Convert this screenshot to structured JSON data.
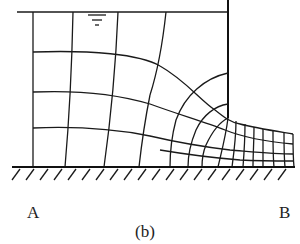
{
  "figure": {
    "caption": "(b)",
    "labels": {
      "left": "A",
      "right": "B"
    },
    "elements": {
      "water_surface_symbol": "water-level-triangle-icon",
      "wall": "sheet-pile-wall",
      "ground": "impervious-base-hatched"
    },
    "colors": {
      "line": "#1a1a1a",
      "background": "#ffffff"
    }
  }
}
